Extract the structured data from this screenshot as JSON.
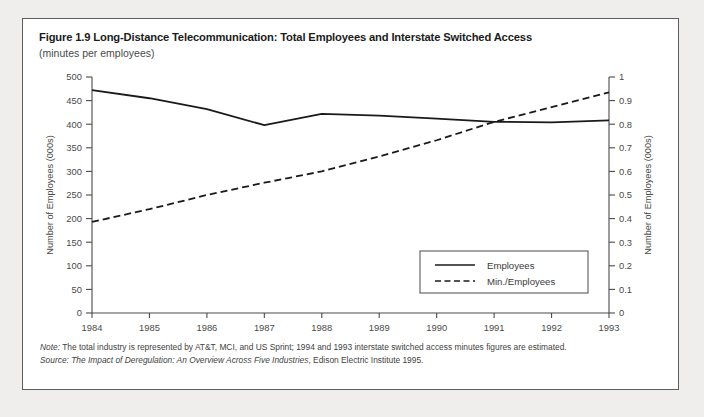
{
  "figure": {
    "title": "Figure 1.9 Long-Distance Telecommunication: Total Employees and Interstate Switched Access",
    "subtitle": "(minutes per employees)"
  },
  "footnotes": {
    "note_lead": "Note:",
    "note_text": " The total industry is represented by AT&T, MCI, and US Sprint; 1994 and 1993 interstate switched access minutes figures are estimated.",
    "source_lead": "Source:",
    "source_em": " The Impact of Deregulation: An Overview Across Five Industries",
    "source_tail": ", Edison Electric Institute 1995."
  },
  "chart_data": {
    "type": "line",
    "title": "Figure 1.9 Long-Distance Telecommunication: Total Employees and Interstate Switched Access",
    "subtitle": "(minutes per employees)",
    "xlabel": "",
    "categories": [
      "1984",
      "1985",
      "1986",
      "1987",
      "1988",
      "1989",
      "1990",
      "1991",
      "1992",
      "1993"
    ],
    "grid": false,
    "legend_position": "inside-lower-right",
    "axes": {
      "left": {
        "label": "Number of Employees (000s)",
        "min": 0,
        "max": 500,
        "step": 50,
        "ticks": [
          "0",
          "50",
          "100",
          "150",
          "200",
          "250",
          "300",
          "350",
          "400",
          "450",
          "500"
        ]
      },
      "right": {
        "label": "Number of Employees (000s)",
        "min": 0,
        "max": 1,
        "step": 0.1,
        "ticks": [
          "0",
          "0.1",
          "0.2",
          "0.3",
          "0.4",
          "0.5",
          "0.6",
          "0.7",
          "0.8",
          "0.9",
          "1"
        ]
      }
    },
    "series": [
      {
        "name": "Employees",
        "axis": "left",
        "style": "solid",
        "color": "#1a1a1a",
        "values": [
          472,
          455,
          432,
          398,
          422,
          418,
          412,
          405,
          404,
          408
        ]
      },
      {
        "name": "Min./Employees",
        "axis": "right",
        "style": "dashed",
        "color": "#1a1a1a",
        "values": [
          0.386,
          0.44,
          0.5,
          0.552,
          0.6,
          0.663,
          0.732,
          0.81,
          0.872,
          0.935
        ]
      }
    ]
  }
}
